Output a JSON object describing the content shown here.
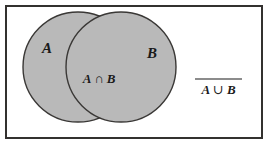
{
  "figure": {
    "kind": "venn-diagram",
    "title_visible": false,
    "background_color": "#ffffff",
    "frame": {
      "name": "outer-frame",
      "stroke_color": "#33312f",
      "stroke_width_px": 2,
      "x": 5,
      "y": 5,
      "width": 258,
      "height": 134
    },
    "fill_color": "#b9b9b9",
    "outline_color": "#3a3836",
    "text_color": "#1a1a1a"
  },
  "sets": {
    "left": {
      "label": "A",
      "cx": 78,
      "cy": 67,
      "r": 55,
      "label_x": 47,
      "label_y": 53
    },
    "right": {
      "label": "B",
      "cx": 121,
      "cy": 67,
      "r": 55,
      "label_x": 152,
      "label_y": 58
    }
  },
  "labels": {
    "intersection": {
      "name": "intersection-label",
      "operand_left": "A",
      "operator": "∩",
      "operand_right": "B",
      "full_text": "A ∩ B",
      "x": 99,
      "y": 83
    },
    "complement": {
      "name": "union-complement-label",
      "operand_left": "A",
      "operator": "∪",
      "operand_right": "B",
      "full_text": "A ∪ B",
      "overline": true,
      "meaning": "complement of A union B",
      "x": 218,
      "y": 94,
      "overline_x1": 195,
      "overline_x2": 242,
      "overline_y": 79
    }
  }
}
